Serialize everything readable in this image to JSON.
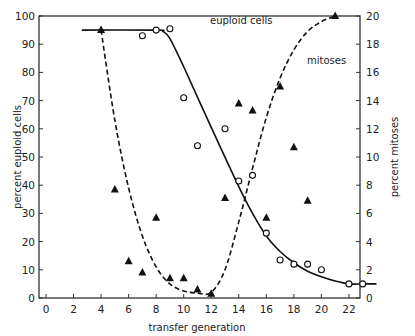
{
  "chart_data": {
    "type": "scatter",
    "title": "",
    "xlabel": "transfer generation",
    "ylabel": "percent euploid cells",
    "y2label": "percent mitoses",
    "xlim": [
      0,
      24
    ],
    "ylim": [
      0,
      100
    ],
    "y2lim": [
      0,
      20
    ],
    "grid": false,
    "x_ticks": [
      0,
      2,
      4,
      6,
      8,
      10,
      12,
      14,
      16,
      18,
      20,
      22
    ],
    "y_ticks": [
      0,
      10,
      20,
      30,
      40,
      50,
      60,
      70,
      80,
      90,
      100
    ],
    "y2_ticks": [
      0,
      2,
      4,
      6,
      8,
      10,
      12,
      14,
      16,
      18,
      20
    ],
    "annotations": [
      "euploid cells",
      "mitoses"
    ],
    "series": [
      {
        "name": "euploid cells",
        "axis": "left",
        "marker": "open-circle",
        "line": "solid",
        "x": [
          7,
          8,
          9,
          10,
          11,
          13,
          14,
          15,
          16,
          17,
          18,
          19,
          20,
          22,
          23
        ],
        "values": [
          93,
          95,
          95.5,
          71,
          54,
          60,
          41.5,
          43.5,
          23,
          13.5,
          12,
          12,
          10,
          5,
          5
        ]
      },
      {
        "name": "mitoses",
        "axis": "right",
        "marker": "filled-triangle",
        "line": "dashed",
        "x": [
          4,
          5,
          6,
          7,
          8,
          9,
          10,
          11,
          12,
          13,
          14,
          15,
          16,
          17,
          18,
          19,
          21
        ],
        "values": [
          19,
          7.7,
          2.6,
          1.8,
          5.7,
          1.4,
          1.4,
          0.6,
          0.3,
          7.1,
          13.8,
          13.3,
          5.7,
          15,
          10.7,
          6.9,
          20
        ]
      }
    ],
    "fitted_curves": {
      "euploid_cells": {
        "x": [
          2.6,
          8,
          8.5,
          9,
          10,
          12,
          14,
          15,
          16,
          17,
          18,
          19,
          20,
          21,
          22,
          23,
          24
        ],
        "y": [
          95,
          95,
          94.5,
          92,
          82,
          60.5,
          39.5,
          30,
          22,
          16.5,
          12.5,
          9.5,
          7.5,
          6,
          5,
          5,
          5
        ]
      },
      "mitoses": {
        "x": [
          4,
          5,
          6,
          7,
          8,
          9,
          10,
          11,
          12,
          13,
          14,
          15,
          16,
          17,
          18,
          19,
          20,
          21
        ],
        "y": [
          19,
          12.6,
          7.8,
          4.4,
          2.2,
          1.0,
          0.5,
          0.35,
          0.4,
          2.0,
          5.4,
          9.2,
          12.8,
          15.6,
          17.6,
          18.9,
          19.6,
          20
        ]
      }
    }
  }
}
